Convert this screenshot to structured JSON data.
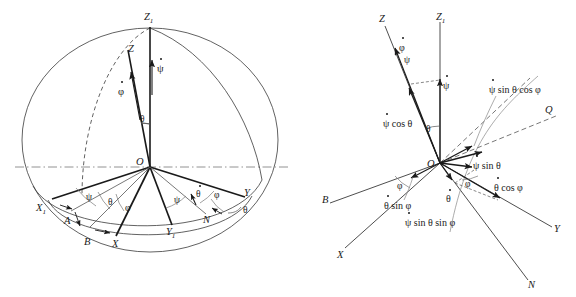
{
  "figure": {
    "type": "diagram",
    "panels": [
      {
        "id": "left",
        "name": "euler-angles-sphere",
        "description": "Sphere with great circles showing Euler angle axes and angular velocity components",
        "origin_label": "O",
        "axis_labels": [
          "Z",
          "Z",
          "X",
          "X",
          "Y",
          "Y",
          "A",
          "B",
          "N"
        ],
        "axes": [
          {
            "name": "Z1",
            "label": "Z",
            "sub": "1"
          },
          {
            "name": "Z",
            "label": "Z",
            "sub": ""
          },
          {
            "name": "X1",
            "label": "X",
            "sub": "1"
          },
          {
            "name": "X",
            "label": "X",
            "sub": ""
          },
          {
            "name": "Y1",
            "label": "Y",
            "sub": "1"
          },
          {
            "name": "Y",
            "label": "Y",
            "sub": ""
          },
          {
            "name": "A",
            "label": "A",
            "sub": ""
          },
          {
            "name": "B",
            "label": "B",
            "sub": ""
          },
          {
            "name": "N",
            "label": "N",
            "sub": ""
          }
        ],
        "rates": [
          {
            "name": "psi-dot",
            "symbol": "ψ"
          },
          {
            "name": "phi-dot",
            "symbol": "φ"
          },
          {
            "name": "theta-dot",
            "symbol": "θ"
          }
        ],
        "angles": [
          {
            "name": "theta-nutation-top",
            "symbol": "θ"
          },
          {
            "name": "psi-precession-left",
            "symbol": "ψ"
          },
          {
            "name": "theta-left",
            "symbol": "θ"
          },
          {
            "name": "phi-spin-left",
            "symbol": "φ"
          },
          {
            "name": "psi-precession-right",
            "symbol": "ψ"
          },
          {
            "name": "phi-spin-right",
            "symbol": "φ"
          },
          {
            "name": "theta-right",
            "symbol": "θ"
          }
        ]
      },
      {
        "id": "right",
        "name": "angular-velocity-components",
        "description": "Resolution of Euler angular rates into body axis components",
        "origin_label": "O",
        "axes": [
          {
            "name": "Z",
            "label": "Z",
            "sub": ""
          },
          {
            "name": "Z1",
            "label": "Z",
            "sub": "1"
          },
          {
            "name": "Q",
            "label": "Q",
            "sub": ""
          },
          {
            "name": "B",
            "label": "B",
            "sub": ""
          },
          {
            "name": "X",
            "label": "X",
            "sub": ""
          },
          {
            "name": "Y",
            "label": "Y",
            "sub": ""
          },
          {
            "name": "N",
            "label": "N",
            "sub": ""
          }
        ],
        "components": [
          {
            "name": "phi-dot",
            "text": "φ"
          },
          {
            "name": "psi-dot",
            "text": "ψ"
          },
          {
            "name": "psi-dot-cos-theta",
            "text": "ψ cos θ"
          },
          {
            "name": "psi-dot-sin-theta",
            "text": "ψ sin θ"
          },
          {
            "name": "psi-dot-sin-theta-cos-phi",
            "text": "ψ sin θ cos φ"
          },
          {
            "name": "psi-dot-sin-theta-sin-phi",
            "text": "ψ sin θ sin φ"
          },
          {
            "name": "theta-dot",
            "text": "θ"
          },
          {
            "name": "theta-dot-sin-phi",
            "text": "θ sin φ"
          },
          {
            "name": "theta-dot-cos-phi",
            "text": "θ cos φ"
          }
        ],
        "angles": [
          {
            "name": "theta-nutation",
            "symbol": "θ"
          },
          {
            "name": "psi-angle",
            "symbol": "ψ"
          },
          {
            "name": "phi-left",
            "symbol": "φ"
          },
          {
            "name": "phi-right",
            "symbol": "φ"
          }
        ]
      }
    ],
    "colors": {
      "stroke": "#1a1a1a",
      "thin": "#555555",
      "dash": "#777777",
      "background": "#ffffff"
    }
  }
}
